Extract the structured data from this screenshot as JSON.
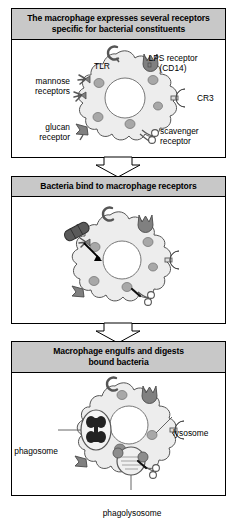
{
  "figure": {
    "type": "three-panel biological process diagram"
  },
  "colors": {
    "header_bar": "#c8c8c8",
    "panel_border": "#000000",
    "cell_body": "#ededed",
    "cell_outline": "#555555",
    "granule": "#a0a0a0",
    "receptor": "#808080",
    "bacteria": "#4a4a4a",
    "nucleus": "#ffffff",
    "text": "#000000",
    "arrow_fill": "#ffffff"
  },
  "panels": [
    {
      "id": "panel-1",
      "header": "The macrophage expresses several receptors specific for bacterial constituents",
      "header_lines": [
        "The macrophage expresses several receptors",
        "specific for bacterial constituents"
      ],
      "labels": [
        {
          "name": "tlr",
          "text": "TLR"
        },
        {
          "name": "lps-receptor",
          "lines": [
            "LPS  receptor",
            "(CD14)"
          ]
        },
        {
          "name": "mannose-receptors",
          "lines": [
            "mannose",
            "receptors"
          ]
        },
        {
          "name": "cr3",
          "text": "CR3"
        },
        {
          "name": "glucan-receptor",
          "lines": [
            "glucan",
            "receptor"
          ]
        },
        {
          "name": "scavenger-receptor",
          "lines": [
            "scavenger",
            "receptor"
          ]
        }
      ]
    },
    {
      "id": "panel-2",
      "header": "Bacteria bind to macrophage receptors",
      "header_lines": [
        "Bacteria bind to macrophage receptors"
      ],
      "labels": []
    },
    {
      "id": "panel-3",
      "header": "Macrophage engulfs and digests bound bacteria",
      "header_lines": [
        "Macrophage engulfs and digests",
        "bound bacteria"
      ],
      "labels": [
        {
          "name": "phagosome",
          "text": "phagosome"
        },
        {
          "name": "lysosome",
          "text": "lysosome"
        },
        {
          "name": "phagolysosome",
          "text": "phagolysosome"
        }
      ]
    }
  ]
}
